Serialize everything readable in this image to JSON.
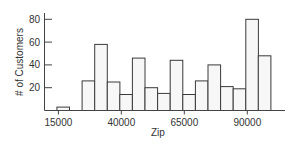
{
  "chart_data": {
    "type": "bar",
    "subtype": "histogram",
    "title": "",
    "xlabel": "Zip",
    "ylabel": "# of Customers",
    "bin_width": 5000,
    "bins": [
      {
        "start": 15000,
        "end": 20000,
        "count": 3
      },
      {
        "start": 20000,
        "end": 25000,
        "count": 0
      },
      {
        "start": 25000,
        "end": 30000,
        "count": 26
      },
      {
        "start": 30000,
        "end": 35000,
        "count": 58
      },
      {
        "start": 35000,
        "end": 40000,
        "count": 25
      },
      {
        "start": 40000,
        "end": 45000,
        "count": 14
      },
      {
        "start": 45000,
        "end": 50000,
        "count": 46
      },
      {
        "start": 50000,
        "end": 55000,
        "count": 20
      },
      {
        "start": 55000,
        "end": 60000,
        "count": 15
      },
      {
        "start": 60000,
        "end": 65000,
        "count": 44
      },
      {
        "start": 65000,
        "end": 70000,
        "count": 14
      },
      {
        "start": 70000,
        "end": 75000,
        "count": 26
      },
      {
        "start": 75000,
        "end": 80000,
        "count": 40
      },
      {
        "start": 80000,
        "end": 85000,
        "count": 21
      },
      {
        "start": 85000,
        "end": 90000,
        "count": 19
      },
      {
        "start": 90000,
        "end": 95000,
        "count": 80
      },
      {
        "start": 95000,
        "end": 100000,
        "count": 48
      }
    ],
    "categories": [
      "15000-20000",
      "20000-25000",
      "25000-30000",
      "30000-35000",
      "35000-40000",
      "40000-45000",
      "45000-50000",
      "50000-55000",
      "55000-60000",
      "60000-65000",
      "65000-70000",
      "70000-75000",
      "75000-80000",
      "80000-85000",
      "85000-90000",
      "90000-95000",
      "95000-100000"
    ],
    "values": [
      3,
      0,
      26,
      58,
      25,
      14,
      46,
      20,
      15,
      44,
      14,
      26,
      40,
      21,
      19,
      80,
      48
    ],
    "x_ticks": [
      15000,
      40000,
      65000,
      90000
    ],
    "x_tick_labels": [
      "15000",
      "40000",
      "65000",
      "90000"
    ],
    "y_ticks": [
      20,
      40,
      60,
      80
    ],
    "y_tick_labels": [
      "20",
      "40",
      "60",
      "80"
    ],
    "xlim": [
      12500,
      105000
    ],
    "ylim": [
      0,
      85
    ],
    "grid": false,
    "legend": null,
    "colors": {
      "bar_fill": "#f7f7f7",
      "bar_stroke": "#3a3a3a",
      "axis": "#444444",
      "text": "#333333"
    }
  }
}
